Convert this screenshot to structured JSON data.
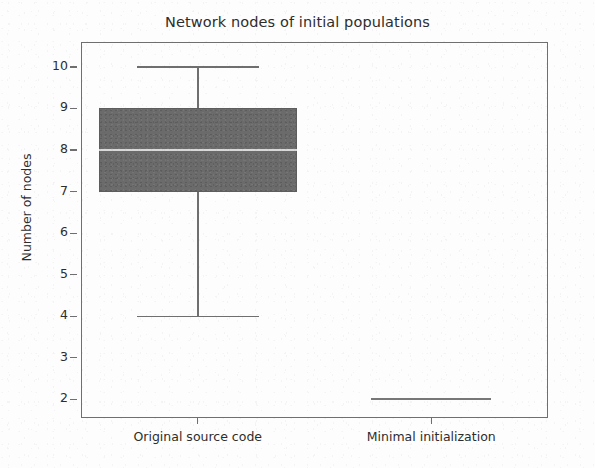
{
  "chart_data": {
    "type": "box",
    "title": "Network nodes of initial populations",
    "xlabel": "",
    "ylabel": "Number of nodes",
    "ylim": [
      1.55,
      10.6
    ],
    "yticks": [
      2,
      3,
      4,
      5,
      6,
      7,
      8,
      9,
      10
    ],
    "ytick_labels": [
      "2",
      "3",
      "4",
      "5",
      "6",
      "7",
      "8",
      "9",
      "10"
    ],
    "grid": false,
    "legend": "none",
    "categories": [
      "Original source code",
      "Minimal initialization"
    ],
    "boxes": [
      {
        "name": "Original source code",
        "whisker_low": 4,
        "q1": 7,
        "median": 8,
        "q3": 9,
        "whisker_high": 10,
        "outliers": [],
        "fill_color": "#6b6b6b",
        "median_color": "#d9d9d9"
      },
      {
        "name": "Minimal initialization",
        "whisker_low": 2,
        "q1": 2,
        "median": 2,
        "q3": 2,
        "whisker_high": 2,
        "outliers": [],
        "fill_color": "#8a8a8a",
        "median_color": "#8a8a8a"
      }
    ]
  },
  "figure": {
    "title": "Network nodes of initial populations",
    "y_axis": {
      "label": "Number of nodes",
      "ticks": [
        {
          "value": 10,
          "label": "10"
        },
        {
          "value": 9,
          "label": "9"
        },
        {
          "value": 8,
          "label": "8"
        },
        {
          "value": 7,
          "label": "7"
        },
        {
          "value": 6,
          "label": "6"
        },
        {
          "value": 5,
          "label": "5"
        },
        {
          "value": 4,
          "label": "4"
        },
        {
          "value": 3,
          "label": "3"
        },
        {
          "value": 2,
          "label": "2"
        }
      ]
    },
    "x_axis": {
      "ticks": [
        {
          "label": "Original source code"
        },
        {
          "label": "Minimal initialization"
        }
      ]
    },
    "colors": {
      "box_fill": "#6b6b6b",
      "box_edge": "#5d5d5d",
      "median": "#d9d9d9",
      "whisker": "#6f6f6f",
      "axis": "#6f6f6f",
      "text": "#2d2d2d",
      "background": "#fdfdfd"
    }
  }
}
